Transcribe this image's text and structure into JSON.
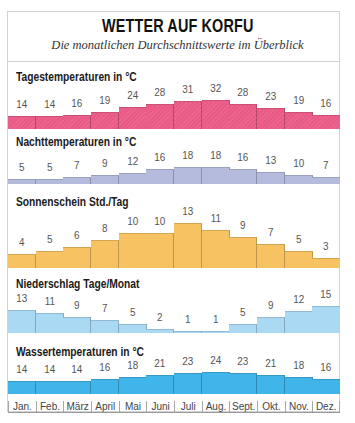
{
  "header": {
    "title": "WETTER AUF KORFU",
    "subtitle": "Die monatlichen Durchschnittswerte im Überblick"
  },
  "months": [
    "Jan.",
    "Feb.",
    "März",
    "April",
    "Mai",
    "Juni",
    "Juli",
    "Aug.",
    "Sept.",
    "Okt.",
    "Nov.",
    "Dez."
  ],
  "chart_data": [
    {
      "type": "bar",
      "title": "Tagestemperaturen in °C",
      "categories": [
        "Jan.",
        "Feb.",
        "März",
        "April",
        "Mai",
        "Juni",
        "Juli",
        "Aug.",
        "Sept.",
        "Okt.",
        "Nov.",
        "Dez."
      ],
      "values": [
        14,
        14,
        16,
        19,
        24,
        28,
        31,
        32,
        28,
        23,
        19,
        16
      ],
      "xlabel": "",
      "ylabel": "°C",
      "color": "#ea5a86",
      "grid": false
    },
    {
      "type": "bar",
      "title": "Nachttemperaturen in °C",
      "categories": [
        "Jan.",
        "Feb.",
        "März",
        "April",
        "Mai",
        "Juni",
        "Juli",
        "Aug.",
        "Sept.",
        "Okt.",
        "Nov.",
        "Dez."
      ],
      "values": [
        5,
        5,
        7,
        9,
        12,
        16,
        18,
        18,
        16,
        13,
        10,
        7
      ],
      "xlabel": "",
      "ylabel": "°C",
      "color": "#b5bbdd",
      "grid": false
    },
    {
      "type": "bar",
      "title": "Sonnenschein Std./Tag",
      "categories": [
        "Jan.",
        "Feb.",
        "März",
        "April",
        "Mai",
        "Juni",
        "Juli",
        "Aug.",
        "Sept.",
        "Okt.",
        "Nov.",
        "Dez."
      ],
      "values": [
        4,
        5,
        6,
        8,
        10,
        10,
        13,
        11,
        9,
        7,
        5,
        3
      ],
      "xlabel": "",
      "ylabel": "Std./Tag",
      "color": "#f7c261",
      "grid": false
    },
    {
      "type": "bar",
      "title": "Niederschlag Tage/Monat",
      "categories": [
        "Jan.",
        "Feb.",
        "März",
        "April",
        "Mai",
        "Juni",
        "Juli",
        "Aug.",
        "Sept.",
        "Okt.",
        "Nov.",
        "Dez."
      ],
      "values": [
        13,
        11,
        9,
        7,
        5,
        2,
        1,
        1,
        5,
        9,
        12,
        15
      ],
      "xlabel": "",
      "ylabel": "Tage/Monat",
      "color": "#aad9f4",
      "grid": false
    },
    {
      "type": "bar",
      "title": "Wassertemperaturen in °C",
      "categories": [
        "Jan.",
        "Feb.",
        "März",
        "April",
        "Mai",
        "Juni",
        "Juli",
        "Aug.",
        "Sept.",
        "Okt.",
        "Nov.",
        "Dez."
      ],
      "values": [
        14,
        14,
        14,
        16,
        18,
        21,
        23,
        24,
        23,
        21,
        18,
        16
      ],
      "xlabel": "",
      "ylabel": "°C",
      "color": "#3fb5e9",
      "grid": false
    }
  ]
}
